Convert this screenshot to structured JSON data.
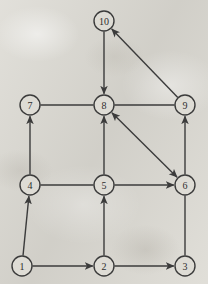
{
  "diagram": {
    "background_color": "#dcdad3",
    "stroke_color": "#3b3b3b",
    "node_fill_color": "#dedcd5",
    "node_radius": 10,
    "width": 208,
    "height": 284,
    "nodes": [
      {
        "id": "1",
        "label": "1",
        "x": 22,
        "y": 266
      },
      {
        "id": "2",
        "label": "2",
        "x": 104,
        "y": 266
      },
      {
        "id": "3",
        "label": "3",
        "x": 185,
        "y": 266
      },
      {
        "id": "4",
        "label": "4",
        "x": 30,
        "y": 185
      },
      {
        "id": "5",
        "label": "5",
        "x": 104,
        "y": 185
      },
      {
        "id": "6",
        "label": "6",
        "x": 185,
        "y": 185
      },
      {
        "id": "7",
        "label": "7",
        "x": 30,
        "y": 105
      },
      {
        "id": "8",
        "label": "8",
        "x": 104,
        "y": 105
      },
      {
        "id": "9",
        "label": "9",
        "x": 185,
        "y": 105
      },
      {
        "id": "10",
        "label": "10",
        "x": 104,
        "y": 21
      }
    ],
    "edges": [
      {
        "from": "1",
        "to": "2",
        "arrow": "forward"
      },
      {
        "from": "2",
        "to": "3",
        "arrow": "forward"
      },
      {
        "from": "1",
        "to": "4",
        "arrow": "forward"
      },
      {
        "from": "2",
        "to": "5",
        "arrow": "forward"
      },
      {
        "from": "3",
        "to": "6",
        "arrow": "none"
      },
      {
        "from": "4",
        "to": "7",
        "arrow": "forward"
      },
      {
        "from": "4",
        "to": "5",
        "arrow": "none"
      },
      {
        "from": "5",
        "to": "6",
        "arrow": "forward"
      },
      {
        "from": "5",
        "to": "8",
        "arrow": "forward"
      },
      {
        "from": "6",
        "to": "9",
        "arrow": "forward"
      },
      {
        "from": "7",
        "to": "8",
        "arrow": "none"
      },
      {
        "from": "8",
        "to": "9",
        "arrow": "none"
      },
      {
        "from": "8",
        "to": "6",
        "arrow": "both"
      },
      {
        "from": "9",
        "to": "10",
        "arrow": "forward"
      },
      {
        "from": "10",
        "to": "8",
        "arrow": "forward"
      }
    ]
  }
}
